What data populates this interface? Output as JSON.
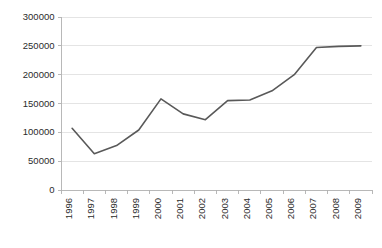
{
  "chart_data": {
    "type": "line",
    "title": "",
    "subtitle": "",
    "xlabel": "",
    "ylabel": "",
    "categories": [
      "1996",
      "1997",
      "1998",
      "1999",
      "2000",
      "2001",
      "2002",
      "2003",
      "2004",
      "2005",
      "2006",
      "2007",
      "2008",
      "2009"
    ],
    "values": [
      107000,
      63000,
      77000,
      104000,
      158000,
      132000,
      122000,
      155000,
      156000,
      172000,
      200000,
      247000,
      249000,
      250000
    ],
    "series": [
      {
        "name": "series-1",
        "values": [
          107000,
          63000,
          77000,
          104000,
          158000,
          132000,
          122000,
          155000,
          156000,
          172000,
          200000,
          247000,
          249000,
          250000
        ]
      }
    ],
    "ylim": [
      0,
      300000
    ],
    "y_ticks": [
      0,
      50000,
      100000,
      150000,
      200000,
      250000,
      300000
    ],
    "y_tick_labels": [
      "0",
      "50000",
      "100000",
      "150000",
      "200000",
      "250000",
      "300000"
    ],
    "x_tick_labels": [
      "1996",
      "1997",
      "1998",
      "1999",
      "2000",
      "2001",
      "2002",
      "2003",
      "2004",
      "2005",
      "2006",
      "2007",
      "2008",
      "2009"
    ],
    "grid": true,
    "grid_axis": "y",
    "legend": false,
    "legend_position": "none",
    "markers": false,
    "x_label_rotation": "90",
    "annotations": []
  },
  "style": {
    "line_color": "#595959",
    "grid_color": "#d9d9d9",
    "axis_color": "#b0b0b0",
    "text_color": "#2b2b2b",
    "background_color": "#ffffff"
  },
  "plot_geometry": {
    "left": 61,
    "right": 372,
    "top": 17,
    "bottom": 190
  }
}
